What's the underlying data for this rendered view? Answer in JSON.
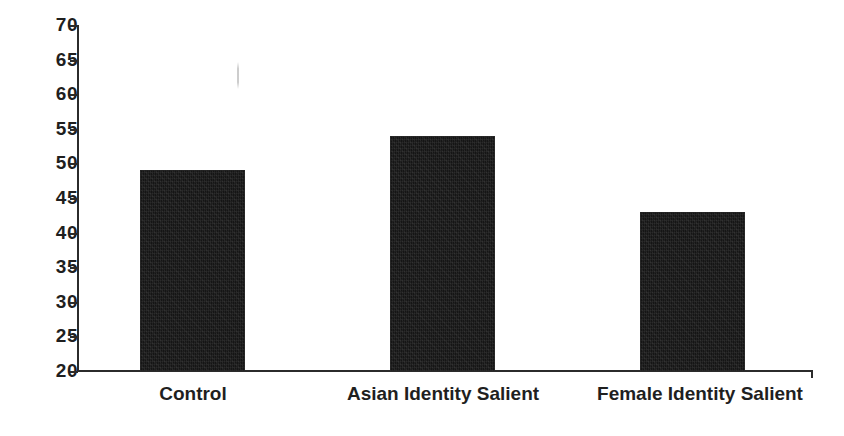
{
  "chart_data": {
    "type": "bar",
    "title": "",
    "subtitle": "",
    "xlabel": "",
    "ylabel": "",
    "categories": [
      "Control",
      "Asian Identity Salient",
      "Female Identity Salient"
    ],
    "values": [
      49,
      54,
      43
    ],
    "series": [
      {
        "name": "",
        "values": [
          49,
          54,
          43
        ]
      }
    ],
    "ylim": [
      20,
      70
    ],
    "ytick_step": 5,
    "ytick_labels": [
      "70",
      "65",
      "60",
      "55",
      "50",
      "45",
      "40",
      "35",
      "30",
      "25",
      "20"
    ],
    "ytick_values": [
      70,
      65,
      60,
      55,
      50,
      45,
      40,
      35,
      30,
      25,
      20
    ],
    "grid": false,
    "legend": false,
    "legend_position": "none",
    "annotations": [],
    "bar_color": "#151515",
    "axis_color": "#2b2b2b",
    "background_color": "#ffffff"
  }
}
